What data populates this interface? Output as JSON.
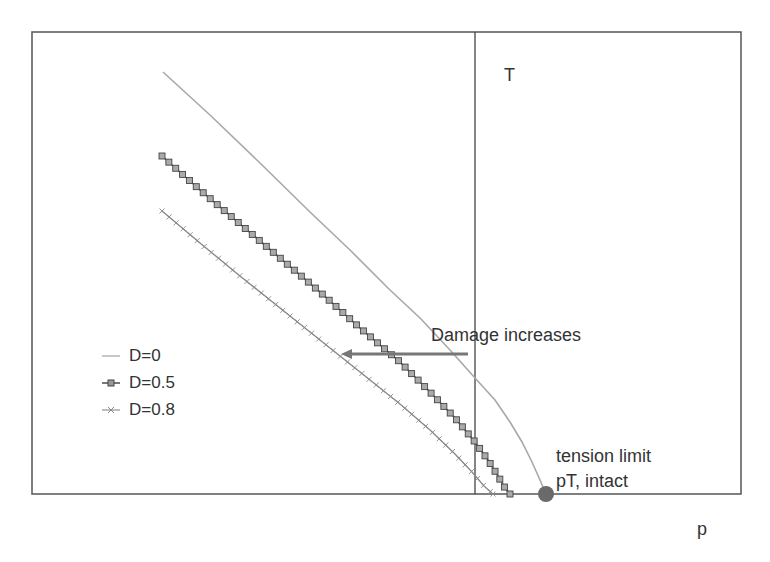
{
  "chart_data": {
    "type": "line",
    "title": "",
    "xlabel": "p",
    "ylabel": "T",
    "grid": false,
    "legend_position": "left-middle",
    "series": [
      {
        "name": "D=0",
        "color": "#a8a8a8",
        "marker": "none",
        "points_px": [
          [
            163,
            72
          ],
          [
            210,
            115
          ],
          [
            260,
            163
          ],
          [
            310,
            212
          ],
          [
            350,
            250
          ],
          [
            390,
            290
          ],
          [
            420,
            318
          ],
          [
            450,
            350
          ],
          [
            475,
            378
          ],
          [
            495,
            400
          ],
          [
            510,
            422
          ],
          [
            522,
            442
          ],
          [
            532,
            462
          ],
          [
            540,
            480
          ],
          [
            546,
            494
          ]
        ]
      },
      {
        "name": "D=0.5",
        "color": "#555555",
        "marker": "square",
        "points_px": [
          [
            162,
            156
          ],
          [
            200,
            190
          ],
          [
            240,
            224
          ],
          [
            280,
            258
          ],
          [
            320,
            292
          ],
          [
            360,
            328
          ],
          [
            400,
            362
          ],
          [
            430,
            392
          ],
          [
            455,
            418
          ],
          [
            475,
            442
          ],
          [
            488,
            460
          ],
          [
            498,
            476
          ],
          [
            505,
            488
          ],
          [
            510,
            494
          ]
        ]
      },
      {
        "name": "D=0.8",
        "color": "#8a8a8a",
        "marker": "x",
        "points_px": [
          [
            162,
            211
          ],
          [
            200,
            243
          ],
          [
            240,
            276
          ],
          [
            280,
            308
          ],
          [
            320,
            340
          ],
          [
            360,
            372
          ],
          [
            400,
            404
          ],
          [
            430,
            430
          ],
          [
            455,
            454
          ],
          [
            472,
            472
          ],
          [
            484,
            486
          ],
          [
            493,
            494
          ]
        ]
      }
    ],
    "annotations": [
      {
        "text": "Damage increases",
        "type": "arrow",
        "from_px": [
          468,
          354
        ],
        "to_px": [
          343,
          354
        ]
      },
      {
        "text": "tension limit",
        "line": 1
      },
      {
        "text": "pT, intact",
        "line": 2,
        "marker": "filled-circle",
        "at_px": [
          546,
          494
        ]
      }
    ],
    "axes": {
      "vertical_axis_label": "T",
      "horizontal_axis_label": "p"
    }
  },
  "labels": {
    "t_axis": "T",
    "p_axis": "p",
    "damage": "Damage increases",
    "tension_line1": "tension limit",
    "tension_line2": "pT, intact"
  },
  "legend": {
    "items": [
      {
        "label": "D=0"
      },
      {
        "label": "D=0.5"
      },
      {
        "label": "D=0.8"
      }
    ]
  }
}
